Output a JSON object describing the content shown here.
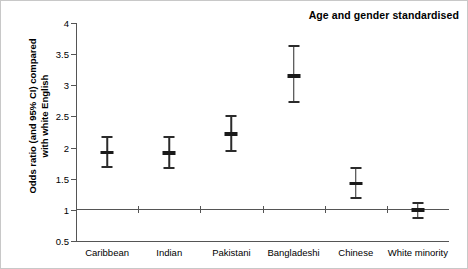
{
  "chart_data": {
    "type": "scatter",
    "title": "Age and gender standardised",
    "xlabel": "",
    "ylabel": "Odds ratio (and 95% CI) compared with white English",
    "ylabel_line1": "Odds ratio (and 95% CI) compared",
    "ylabel_line2": "with white English",
    "categories": [
      "Caribbean",
      "Indian",
      "Pakistani",
      "Bangladeshi",
      "Chinese",
      "White minority"
    ],
    "values": [
      1.92,
      1.91,
      2.22,
      3.15,
      1.42,
      1.0
    ],
    "ci_lower": [
      1.68,
      1.66,
      1.93,
      2.71,
      1.18,
      0.86
    ],
    "ci_upper": [
      2.18,
      2.19,
      2.53,
      3.65,
      1.69,
      1.12
    ],
    "ylim": [
      0.5,
      4
    ],
    "yticks": [
      0.5,
      1,
      1.5,
      2,
      2.5,
      3,
      3.5,
      4
    ],
    "ytick_labels": [
      "0.5",
      "1",
      "1.5",
      "2",
      "2.5",
      "3",
      "3.5",
      "4"
    ],
    "reference_line": 1,
    "grid": false,
    "legend": "none",
    "marker_color": "#1a1a1a",
    "axis_color": "#555555"
  }
}
